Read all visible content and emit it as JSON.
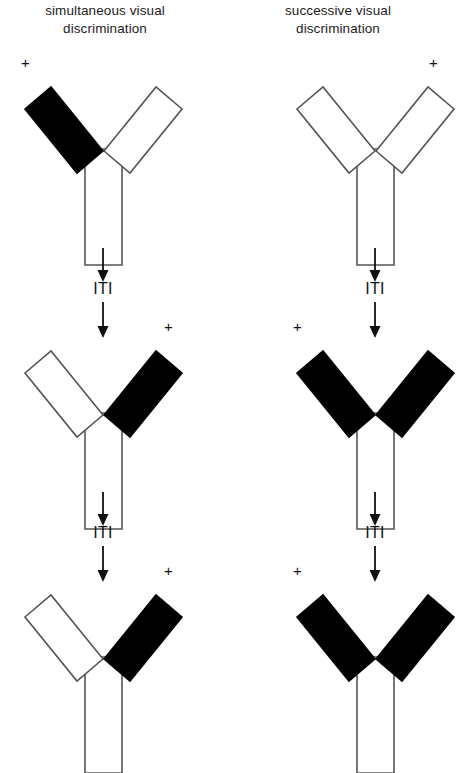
{
  "figure": {
    "background_color": "#ffffff",
    "ink_color": "#111111",
    "arm_fill_black": "#000000",
    "arm_fill_white": "#ffffff",
    "outline_color": "#555555"
  },
  "columns": [
    {
      "id": "simultaneous",
      "title_line1": "simultaneous visual",
      "title_line2": "discrimination",
      "trials": [
        {
          "index": 1,
          "left_arm": "black",
          "right_arm": "white",
          "stem": "white",
          "reward_marker": "+",
          "reward_side": "left"
        },
        {
          "index": 2,
          "left_arm": "white",
          "right_arm": "black",
          "stem": "white",
          "reward_marker": "+",
          "reward_side": "right"
        },
        {
          "index": 3,
          "left_arm": "white",
          "right_arm": "black",
          "stem": "white",
          "reward_marker": "+",
          "reward_side": "right"
        }
      ]
    },
    {
      "id": "successive",
      "title_line1": "successive visual",
      "title_line2": "discrimination",
      "trials": [
        {
          "index": 1,
          "left_arm": "white",
          "right_arm": "white",
          "stem": "white",
          "reward_marker": "+",
          "reward_side": "right"
        },
        {
          "index": 2,
          "left_arm": "black",
          "right_arm": "black",
          "stem": "white",
          "reward_marker": "+",
          "reward_side": "left"
        },
        {
          "index": 3,
          "left_arm": "black",
          "right_arm": "black",
          "stem": "white",
          "reward_marker": "+",
          "reward_side": "left"
        }
      ]
    }
  ],
  "transitions": {
    "label": "ITI",
    "arrow_glyph": "down-arrow",
    "count_per_column": 2
  }
}
